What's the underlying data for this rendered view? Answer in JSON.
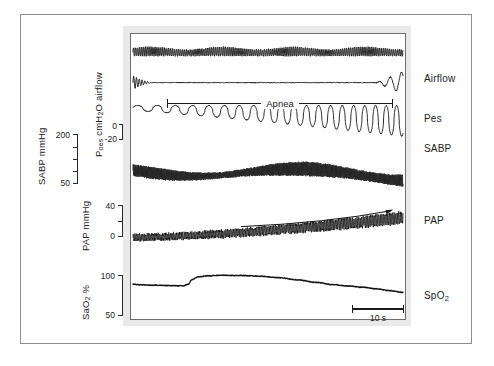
{
  "figure": {
    "annotations": {
      "apnea_label": "Apnea",
      "time_scale_label": "10 s"
    }
  },
  "left_axes": [
    {
      "name": "sabp",
      "title": "SABP mmHg",
      "unit": "mmHg",
      "max_label": "200",
      "min_label": "50",
      "ticks": [
        "200",
        "50"
      ]
    },
    {
      "name": "poes",
      "title_html": "P_oes cmH2O airflow",
      "title_main": "oes",
      "title_pre": "P",
      "title_post": " cmH",
      "title_sub2": "2",
      "title_end": "O airflow",
      "max_label": "0",
      "min_label": "-20"
    },
    {
      "name": "pap",
      "title": "PAP mmHg",
      "max_label": "40",
      "min_label": "0"
    },
    {
      "name": "sao2",
      "title_pre": "SaO",
      "title_sub": "2",
      "title_post": " %",
      "max_label": "100",
      "min_label": "50"
    }
  ],
  "right_labels": [
    {
      "name": "airflow",
      "text": "Airflow"
    },
    {
      "name": "pes",
      "text": "Pes"
    },
    {
      "name": "sabp",
      "text": "SABP"
    },
    {
      "name": "pap",
      "text": "PAP"
    },
    {
      "name": "spo2_pre",
      "text": "SpO",
      "sub": "2"
    }
  ],
  "chart_data": {
    "type": "line",
    "xlabel": "Time",
    "ylabel": "",
    "grid": false,
    "legend_position": "right",
    "time_scale": {
      "label": "10 s",
      "seconds": 10
    },
    "annotations": [
      {
        "type": "span",
        "label": "Apnea",
        "channel": "airflow",
        "note": "bracket spanning the apneic period"
      },
      {
        "type": "arrow",
        "label": "",
        "channel": "pap",
        "note": "upward trend arrow over rising pulmonary artery pressure"
      }
    ],
    "channels": [
      {
        "name": "respiratory_movement",
        "label": "",
        "units": "",
        "description": "dense high-frequency oscillation, continuous throughout",
        "ylim": [
          0,
          1
        ]
      },
      {
        "name": "airflow",
        "label": "Airflow",
        "units": "",
        "description": "oscillating at start, flat (absent) through apnea, resumes with large breath at end",
        "ylim": [
          0,
          1
        ]
      },
      {
        "name": "pes",
        "label": "Pes",
        "units": "cmH2O",
        "ylim": [
          -20,
          0
        ],
        "yticks": [
          0,
          -20
        ],
        "description": "negative inspiratory swings progressively deepening during apnea"
      },
      {
        "name": "sabp",
        "label": "SABP",
        "units": "mmHg",
        "ylim": [
          50,
          200
        ],
        "yticks": [
          50,
          200
        ],
        "description": "beat-to-beat systemic arterial pressure oscillations, rising late in apnea"
      },
      {
        "name": "pap",
        "label": "PAP",
        "units": "mmHg",
        "ylim": [
          0,
          40
        ],
        "yticks": [
          0,
          40
        ],
        "description": "pulmonary artery pressure rising progressively through the apnea"
      },
      {
        "name": "spo2",
        "label": "SpO2",
        "units": "%",
        "ylim": [
          50,
          100
        ],
        "yticks": [
          50,
          100
        ],
        "description": "rises to plateau near 100% then progressively desaturates"
      }
    ]
  },
  "colors": {
    "trace": "#111111",
    "panel_border": "#e9e9e9",
    "frame": "#8d8d8d",
    "text": "#1b1b1b"
  }
}
